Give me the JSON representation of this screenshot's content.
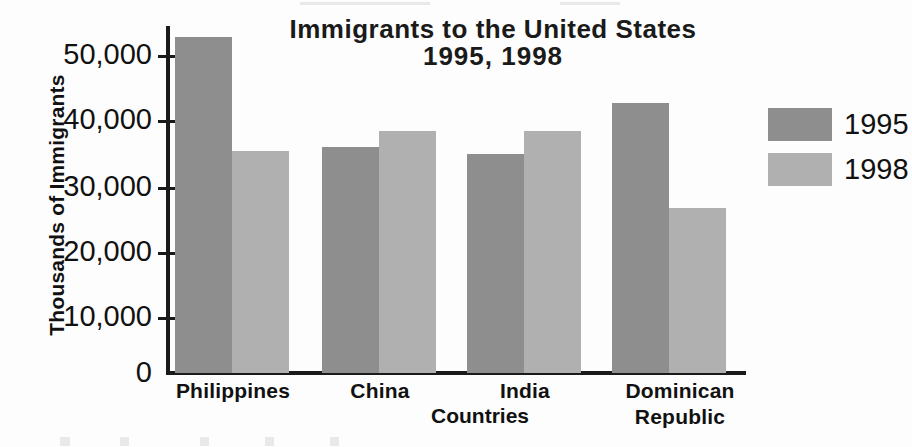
{
  "chart_data": {
    "type": "bar",
    "title": "Immigrants to the United States",
    "subtitle": "1995, 1998",
    "xlabel": "Countries",
    "ylabel": "Thousands of Immigrants",
    "categories": [
      "Philippines",
      "China",
      "India",
      "Dominican Republic"
    ],
    "series": [
      {
        "name": "1995",
        "color": "#8e8e8e",
        "values": [
          52800,
          35500,
          34500,
          42500
        ]
      },
      {
        "name": "1998",
        "color": "#b0b0b0",
        "values": [
          34900,
          38000,
          38000,
          26000
        ]
      }
    ],
    "ylim": [
      0,
      55000
    ],
    "ytick_labels": [
      "50,000",
      "40,000",
      "30,000",
      "20,000",
      "10,000",
      "0"
    ],
    "ytick_values": [
      50000,
      40000,
      30000,
      20000,
      10000,
      0
    ],
    "grid": false,
    "legend_position": "right"
  },
  "legend": {
    "items": [
      {
        "label": "1995",
        "color": "#8e8e8e"
      },
      {
        "label": "1998",
        "color": "#b0b0b0"
      }
    ]
  },
  "categories": [
    {
      "line1": "Philippines",
      "line2": ""
    },
    {
      "line1": "China",
      "line2": ""
    },
    {
      "line1": "India",
      "line2": ""
    },
    {
      "line1": "Dominican",
      "line2": "Republic"
    }
  ],
  "axis": {
    "y_title": "Thousands of Immigrants",
    "x_title": "Countries",
    "ticks": [
      {
        "label": "50,000",
        "value": 50000
      },
      {
        "label": "40,000",
        "value": 40000
      },
      {
        "label": "30,000",
        "value": 30000
      },
      {
        "label": "20,000",
        "value": 20000
      },
      {
        "label": "10,000",
        "value": 10000
      },
      {
        "label": "0",
        "value": 0
      }
    ]
  },
  "title": {
    "line1": "Immigrants to the United States",
    "line2": "1995, 1998"
  }
}
